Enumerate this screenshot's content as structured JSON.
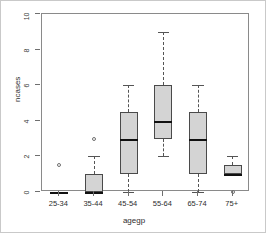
{
  "chart_data": {
    "type": "box",
    "title": "",
    "xlabel": "agegp",
    "ylabel": "ncases",
    "categories": [
      "25-34",
      "35-44",
      "45-54",
      "55-64",
      "65-74",
      "75+"
    ],
    "ylim": [
      0,
      10
    ],
    "yticks": [
      0,
      2,
      4,
      6,
      8,
      10
    ],
    "ytick_labels": [
      "0",
      "2",
      "4",
      "6",
      "8",
      "10"
    ],
    "grid": false,
    "legend": null,
    "boxes": [
      {
        "category": "25-34",
        "whisker_low": 0,
        "q1": 0,
        "median": 0,
        "q3": 0,
        "whisker_high": 0,
        "outliers": [
          1.5
        ]
      },
      {
        "category": "35-44",
        "whisker_low": 0,
        "q1": 0,
        "median": 0,
        "q3": 1,
        "whisker_high": 2,
        "outliers": [
          3
        ]
      },
      {
        "category": "45-54",
        "whisker_low": 0,
        "q1": 1,
        "median": 3,
        "q3": 4.5,
        "whisker_high": 6,
        "outliers": []
      },
      {
        "category": "55-64",
        "whisker_low": 2,
        "q1": 3,
        "median": 4,
        "q3": 6,
        "whisker_high": 9,
        "outliers": []
      },
      {
        "category": "65-74",
        "whisker_low": 0,
        "q1": 1,
        "median": 3,
        "q3": 4.5,
        "whisker_high": 6,
        "outliers": []
      },
      {
        "category": "75+",
        "whisker_low": 1,
        "q1": 1,
        "median": 1,
        "q3": 1.5,
        "whisker_high": 2,
        "outliers": [
          0
        ]
      }
    ],
    "colors": {
      "box_fill": "#d4d4d4",
      "box_border": "#4a4a4a",
      "median": "#111111",
      "whisker": "#555555",
      "outlier": "#707070",
      "frame": "#8a8a8a",
      "background": "#ffffff"
    }
  }
}
